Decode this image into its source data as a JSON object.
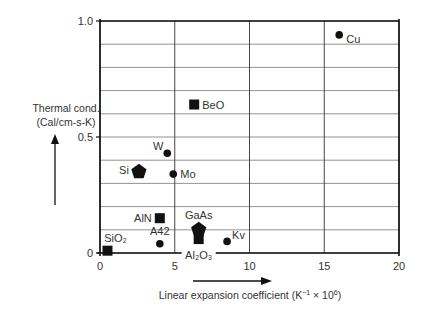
{
  "chart_data": {
    "type": "scatter",
    "title": "",
    "xlabel": "Linear expansion coefficient (K⁻¹ × 10⁶)",
    "ylabel": "Thermal cond. (Cal/cm-s-K)",
    "ylabel_line1": "Thermal cond.",
    "ylabel_line2": "(Cal/cm-s-K)",
    "xlim": [
      0,
      20
    ],
    "ylim": [
      0,
      1.0
    ],
    "x_ticks": [
      0,
      5,
      10,
      15,
      20
    ],
    "x_tick_labels": [
      "0",
      "5",
      "10",
      "15",
      "20"
    ],
    "y_ticks": [
      0,
      0.5,
      1.0
    ],
    "y_tick_labels": [
      "0",
      "0.5",
      "1.0"
    ],
    "grid": true,
    "grid_x_step": 5,
    "grid_y_step": 0.1,
    "legend": null,
    "points": [
      {
        "label": "Cu",
        "x": 16.0,
        "y": 0.94,
        "marker": "circle"
      },
      {
        "label": "BeO",
        "x": 6.3,
        "y": 0.64,
        "marker": "square"
      },
      {
        "label": "W",
        "x": 4.5,
        "y": 0.43,
        "marker": "circle"
      },
      {
        "label": "Si",
        "x": 2.6,
        "y": 0.35,
        "marker": "pentagon"
      },
      {
        "label": "Mo",
        "x": 4.9,
        "y": 0.34,
        "marker": "circle"
      },
      {
        "label": "AlN",
        "x": 4.0,
        "y": 0.15,
        "marker": "square"
      },
      {
        "label": "GaAs",
        "x": 6.6,
        "y": 0.1,
        "marker": "pentagon"
      },
      {
        "label": "Al₂O₃",
        "x": 6.6,
        "y": 0.06,
        "marker": "square"
      },
      {
        "label": "A42",
        "x": 4.0,
        "y": 0.04,
        "marker": "circle"
      },
      {
        "label": "Kv",
        "x": 8.5,
        "y": 0.05,
        "marker": "circle"
      },
      {
        "label": "SiO₂",
        "x": 0.5,
        "y": 0.01,
        "marker": "square"
      }
    ]
  }
}
